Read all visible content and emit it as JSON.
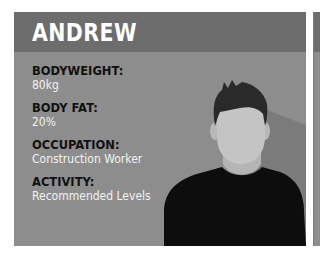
{
  "profile": {
    "name": "ANDREW",
    "stats": [
      {
        "label": "BODYWEIGHT:",
        "value": "80kg"
      },
      {
        "label": "BODY FAT:",
        "value": "20%"
      },
      {
        "label": "OCCUPATION:",
        "value": "Construction Worker"
      },
      {
        "label": "ACTIVITY:",
        "value": "Recommended Levels"
      }
    ]
  },
  "colors": {
    "header": "#6d6d6d",
    "body": "#8d8d8d",
    "shadow": "#7a7a7a",
    "skin": "#c2c2c2",
    "hair": "#2a2a2a",
    "shirt": "#0d0d0d",
    "label": "#111111",
    "value": "#f2f2f2"
  }
}
